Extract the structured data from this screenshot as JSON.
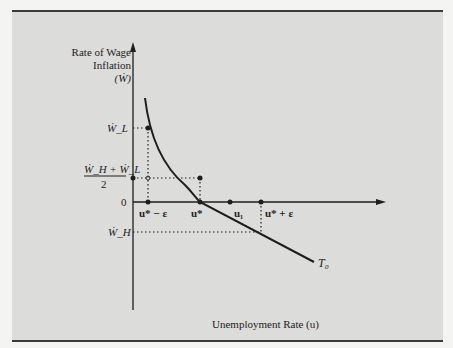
{
  "diagram": {
    "y_axis_label": [
      "Rate of Wage",
      "Inflation",
      "(Ẇ)"
    ],
    "x_axis_label": "Unemployment Rate (u)",
    "y_ticks": {
      "w_l": "Ẇ_L",
      "midpoint_numerator": "Ẇ_H + Ẇ_L",
      "midpoint_denominator": "2",
      "zero": "0",
      "w_h": "Ẇ_H"
    },
    "x_ticks": {
      "u_star_minus": "u* − ε",
      "u_star": "u*",
      "u_1": "u₁",
      "u_star_plus": "u* + ε"
    },
    "curve_label": "T₀",
    "colors": {
      "background": "#dcdcda",
      "ink": "#1e1e1e",
      "border": "#3a3a3a"
    }
  }
}
